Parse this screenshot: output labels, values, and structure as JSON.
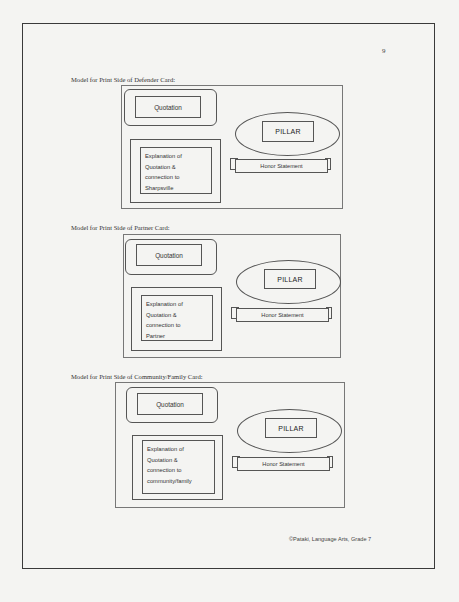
{
  "page": {
    "number": "9",
    "footer": "©Pataki, Language Arts, Grade 7"
  },
  "cards": [
    {
      "caption": "Model for Print Side of Defender Card:",
      "quotation": "Quotation",
      "explanation": [
        "Explanation of",
        "Quotation &",
        "connection to",
        "Sharpsville"
      ],
      "pillar": "PILLAR",
      "honor": "Honor Statement"
    },
    {
      "caption": "Model for Print Side of Partner Card:",
      "quotation": "Quotation",
      "explanation": [
        "Explanation of",
        "Quotation &",
        "connection to",
        "Partner"
      ],
      "pillar": "PILLAR",
      "honor": "Honor Statement"
    },
    {
      "caption": "Model for Print Side of Community/Family Card:",
      "quotation": "Quotation",
      "explanation": [
        "Explanation of",
        "Quotation &",
        "connection to",
        "community/family"
      ],
      "pillar": "PILLAR",
      "honor": "Honor Statement"
    }
  ]
}
